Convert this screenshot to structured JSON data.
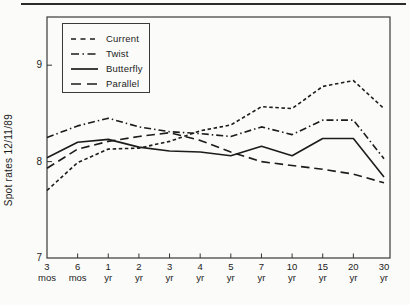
{
  "page": {
    "background": "#fbfbf9",
    "ink": "#1c1c1c",
    "axis_color": "#3a3a3a",
    "top_rule_color": "#2b2b2b"
  },
  "chart_data": {
    "type": "line",
    "title": "",
    "xlabel": "",
    "ylabel": "Spot rates 12/11/89",
    "categories": [
      "3 mos",
      "6 mos",
      "1 yr",
      "2 yr",
      "3 yr",
      "4 yr",
      "5 yr",
      "7 yr",
      "10 yr",
      "15 yr",
      "20 yr",
      "30 yr"
    ],
    "yticks": [
      7,
      8,
      9
    ],
    "ylim": [
      7,
      9.5
    ],
    "grid": false,
    "legend_position": "top-left",
    "line_color": "#1c1c1c",
    "series": [
      {
        "name": "Current",
        "style": "short-dash",
        "values": [
          7.7,
          7.99,
          8.13,
          8.14,
          8.21,
          8.32,
          8.38,
          8.57,
          8.55,
          8.78,
          8.84,
          8.55
        ]
      },
      {
        "name": "Twist",
        "style": "dash-dot",
        "values": [
          8.25,
          8.37,
          8.45,
          8.36,
          8.31,
          8.29,
          8.26,
          8.36,
          8.28,
          8.43,
          8.43,
          8.03
        ]
      },
      {
        "name": "Butterfly",
        "style": "solid",
        "values": [
          8.04,
          8.2,
          8.23,
          8.15,
          8.11,
          8.1,
          8.06,
          8.16,
          8.06,
          8.24,
          8.24,
          7.84
        ]
      },
      {
        "name": "Parallel",
        "style": "long-dash",
        "values": [
          7.93,
          8.13,
          8.21,
          8.26,
          8.3,
          8.22,
          8.1,
          8.0,
          7.96,
          7.92,
          7.87,
          7.78
        ]
      }
    ]
  }
}
